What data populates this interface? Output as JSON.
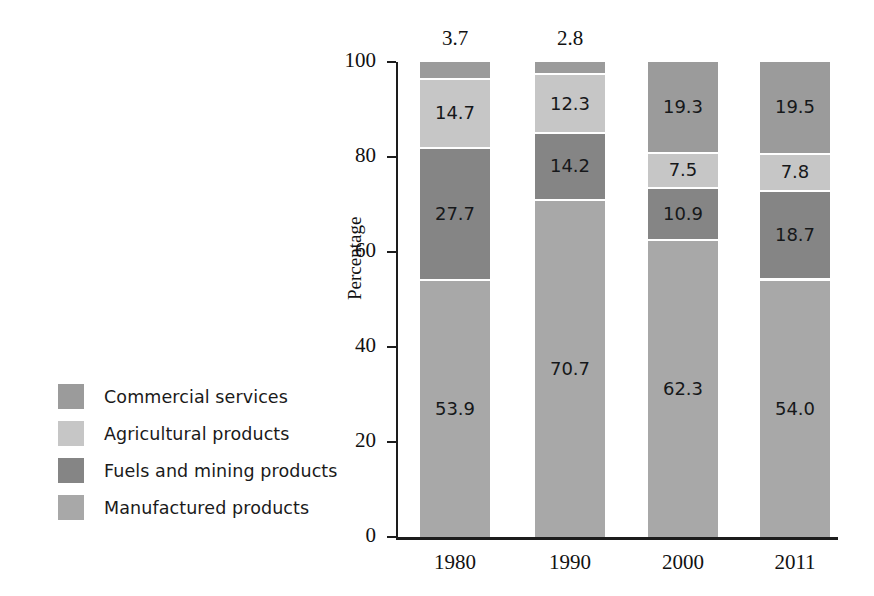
{
  "chart_data": {
    "type": "bar",
    "subtype": "stacked-bar-100-percent",
    "title": "",
    "xlabel": "",
    "ylabel": "Percentage",
    "ylim": [
      0,
      100
    ],
    "yticks": [
      0,
      20,
      40,
      60,
      80,
      100
    ],
    "grid": false,
    "legend_position": "left",
    "categories": [
      "1980",
      "1990",
      "2000",
      "2011"
    ],
    "series": [
      {
        "name": "Manufactured products",
        "color": "#a8a8a8",
        "values": [
          53.9,
          70.7,
          62.3,
          54.0
        ],
        "labels": [
          "53.9",
          "70.7",
          "62.3",
          "54.0"
        ]
      },
      {
        "name": "Fuels and mining products",
        "color": "#858585",
        "values": [
          27.7,
          14.2,
          10.9,
          18.7
        ],
        "labels": [
          "27.7",
          "14.2",
          "10.9",
          "18.7"
        ]
      },
      {
        "name": "Agricultural products",
        "color": "#c6c6c6",
        "values": [
          14.7,
          12.3,
          7.5,
          7.8
        ],
        "labels": [
          "14.7",
          "12.3",
          "7.5",
          "7.8"
        ]
      },
      {
        "name": "Commercial services",
        "color": "#9b9b9b",
        "values": [
          3.7,
          2.8,
          19.3,
          19.5
        ],
        "labels": [
          "3.7",
          "2.8",
          "19.3",
          "19.5"
        ],
        "labels_outside": [
          true,
          true,
          false,
          false
        ]
      }
    ]
  },
  "legend": {
    "items": [
      {
        "label": "Commercial services",
        "color": "#9b9b9b"
      },
      {
        "label": "Agricultural products",
        "color": "#c6c6c6"
      },
      {
        "label": "Fuels and mining products",
        "color": "#858585"
      },
      {
        "label": "Manufactured products",
        "color": "#a8a8a8"
      }
    ]
  },
  "axes": {
    "y_title": "Percentage",
    "y_tick_labels": [
      "100",
      "80",
      "60",
      "40",
      "20",
      "0"
    ],
    "x_tick_labels": [
      "1980",
      "1990",
      "2000",
      "2011"
    ]
  },
  "annotations": {
    "top_labels": [
      {
        "category": "1980",
        "text": "3.7"
      },
      {
        "category": "1990",
        "text": "2.8"
      }
    ]
  },
  "colors": {
    "commercial_services": "#9b9b9b",
    "agricultural_products": "#c6c6c6",
    "fuels_and_mining_products": "#858585",
    "manufactured_products": "#a8a8a8",
    "axis": "#1d1d1d",
    "text": "#111111",
    "background": "#ffffff"
  }
}
